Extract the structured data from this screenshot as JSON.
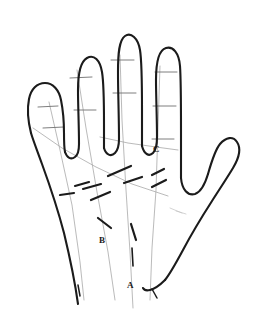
{
  "figure": {
    "kind": "line-drawing",
    "view": "palmar",
    "background_color": "#ffffff",
    "outline_color": "#1b1b1b",
    "crease_color": "#6f6f6f",
    "ray_color": "#9a9a9a",
    "dash_color": "#1b1b1b"
  },
  "labels": {
    "a": "A",
    "b": "B",
    "c": "C"
  },
  "parts": {
    "pinky": "pinky-finger",
    "ring": "ring-finger",
    "middle": "middle-finger",
    "index": "index-finger",
    "thumb": "thumb",
    "palm": "palm",
    "wrist": "wrist"
  }
}
